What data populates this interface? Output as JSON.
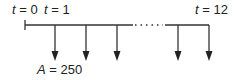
{
  "diagram": {
    "type": "cash-flow timeline",
    "labels": {
      "start": {
        "var": "t",
        "eq": " = 0"
      },
      "first": {
        "var": "t",
        "eq": " = 1"
      },
      "last": {
        "var": "t",
        "eq": " = 12"
      },
      "amount": {
        "var": "A",
        "eq": " = 250"
      }
    },
    "periods_shown": [
      1,
      2,
      3,
      11,
      12
    ],
    "flow_direction": "down",
    "ellipsis": "......",
    "line_color": "#333333"
  }
}
